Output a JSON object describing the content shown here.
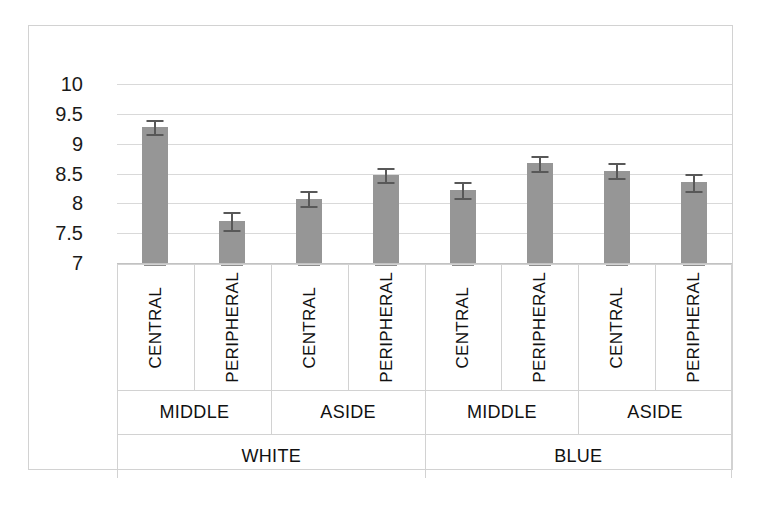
{
  "chart_data": {
    "type": "bar",
    "title": "",
    "subtitle": "",
    "xlabel": "",
    "ylabel": "",
    "ylim": [
      7,
      10
    ],
    "y_ticks": [
      "10",
      "9.5",
      "9",
      "8.5",
      "8",
      "7.5",
      "7"
    ],
    "y_tick_values": [
      10,
      9.5,
      9,
      8.5,
      8,
      7.5,
      7
    ],
    "grid": true,
    "legend": "none",
    "error_bars": "symmetric",
    "group_levels": [
      "colour",
      "position",
      "region"
    ],
    "top_groups": [
      {
        "label": "WHITE",
        "span": 4
      },
      {
        "label": "BLUE",
        "span": 4
      }
    ],
    "mid_groups": [
      {
        "label": "MIDDLE",
        "span": 2
      },
      {
        "label": "ASIDE",
        "span": 2
      },
      {
        "label": "MIDDLE",
        "span": 2
      },
      {
        "label": "ASIDE",
        "span": 2
      }
    ],
    "categories": [
      "CENTRAL",
      "PERIPHERAL",
      "CENTRAL",
      "PERIPHERAL",
      "CENTRAL",
      "PERIPHERAL",
      "CENTRAL",
      "PERIPHERAL"
    ],
    "values": [
      9.28,
      7.7,
      8.08,
      8.48,
      8.22,
      8.67,
      8.55,
      8.35
    ],
    "errors": [
      0.12,
      0.15,
      0.13,
      0.12,
      0.13,
      0.13,
      0.13,
      0.14
    ],
    "bars": [
      {
        "colour": "WHITE",
        "position": "MIDDLE",
        "region": "CENTRAL",
        "value": 9.28,
        "error": 0.12
      },
      {
        "colour": "WHITE",
        "position": "MIDDLE",
        "region": "PERIPHERAL",
        "value": 7.7,
        "error": 0.15
      },
      {
        "colour": "WHITE",
        "position": "ASIDE",
        "region": "CENTRAL",
        "value": 8.08,
        "error": 0.13
      },
      {
        "colour": "WHITE",
        "position": "ASIDE",
        "region": "PERIPHERAL",
        "value": 8.48,
        "error": 0.12
      },
      {
        "colour": "BLUE",
        "position": "MIDDLE",
        "region": "CENTRAL",
        "value": 8.22,
        "error": 0.13
      },
      {
        "colour": "BLUE",
        "position": "MIDDLE",
        "region": "PERIPHERAL",
        "value": 8.67,
        "error": 0.13
      },
      {
        "colour": "BLUE",
        "position": "ASIDE",
        "region": "CENTRAL",
        "value": 8.55,
        "error": 0.13
      },
      {
        "colour": "BLUE",
        "position": "ASIDE",
        "region": "PERIPHERAL",
        "value": 8.35,
        "error": 0.14
      }
    ],
    "colors": {
      "bar_fill": "#969696",
      "error_bar": "#585858",
      "gridline": "#d9d9d9",
      "frame": "#d2d2d2",
      "text": "#111111",
      "background": "#ffffff"
    }
  }
}
